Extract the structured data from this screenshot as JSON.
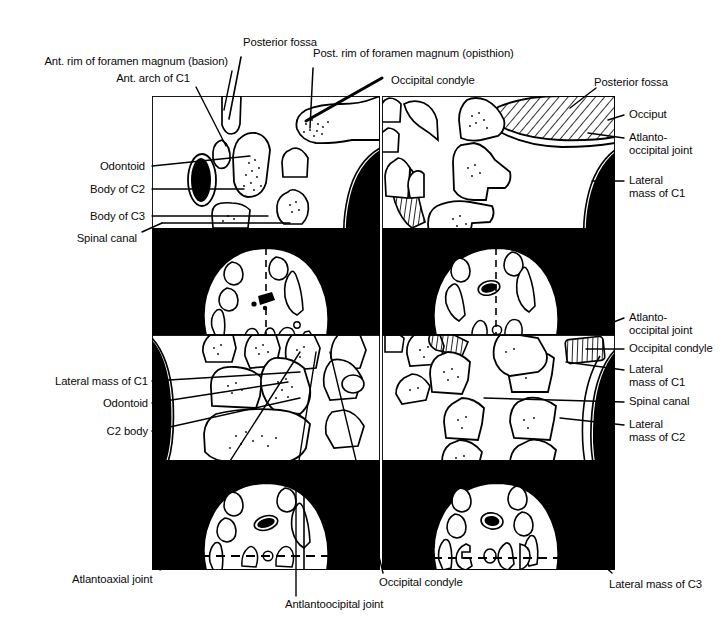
{
  "figure": {
    "kind": "anatomical-line-drawing",
    "panel_count": 8,
    "colors": {
      "ink": "#000000",
      "paper": "#ffffff",
      "panel_background_axial": "#000000",
      "panel_background_sagittal": "#ffffff"
    }
  },
  "labels": {
    "posterior_fossa_top": "Posterior fossa",
    "ant_rim_foramen_magnum": "Ant. rim of foramen magnum (basion)",
    "ant_arch_c1": "Ant. arch of C1",
    "post_rim_foramen_magnum": "Post. rim of foramen magnum (opisthion)",
    "occipital_condyle_top": "Occipital condyle",
    "posterior_fossa_right": "Posterior fossa",
    "occiput": "Occiput",
    "atlanto_occipital_joint_right_1_line1": "Atlanto-",
    "atlanto_occipital_joint_right_1_line2": "occipital joint",
    "lateral_mass_c1_right_1_line1": "Lateral",
    "lateral_mass_c1_right_1_line2": "mass of C1",
    "odontoid_left_1": "Odontoid",
    "body_of_c2": "Body of C2",
    "body_of_c3": "Body of C3",
    "spinal_canal_left": "Spinal canal",
    "atlanto_occipital_joint_right_2_line1": "Atlanto-",
    "atlanto_occipital_joint_right_2_line2": "occipital joint",
    "occipital_condyle_right": "Occipital condyle",
    "lateral_mass_c1_right_2_line1": "Lateral",
    "lateral_mass_c1_right_2_line2": "mass of C1",
    "spinal_canal_right": "Spinal canal",
    "lateral_mass_c2_line1": "Lateral",
    "lateral_mass_c2_line2": "mass of C2",
    "lateral_mass_c1_left": "Lateral mass of C1",
    "odontoid_left_2": "Odontoid",
    "c2_body": "C2 body",
    "atlantoaxial_joint": "Atlantoaxial joint",
    "antlantoocipital_joint": "Antlantoocipital joint",
    "occipital_condyle_bottom": "Occipital condyle",
    "lateral_mass_c3": "Lateral mass of C3"
  }
}
